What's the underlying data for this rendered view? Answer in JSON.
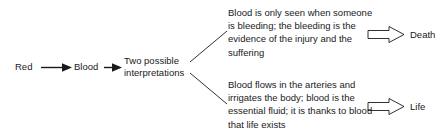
{
  "diagram": {
    "title": "Red Blood Two possible interpretations",
    "background_color": "#ffffff",
    "line_color": "#1a1a1a",
    "text_color": "#1a1a1a",
    "chain": {
      "node_1": "Red",
      "node_2": "Blood",
      "node_3_line_1": "Two possible",
      "node_3_line_2": "interpretations"
    },
    "branches": {
      "upper": {
        "text_line_1": "Blood is only seen when someone",
        "text_line_2": "is bleeding; the bleeding is the",
        "text_line_3": "evidence of the injury and the",
        "text_line_4": "suffering",
        "outcome": "Death"
      },
      "lower": {
        "text_line_1": "Blood flows in the arteries and",
        "text_line_2": "irrigates the body; blood is the",
        "text_line_3": "essential fluid; it is thanks to blood",
        "text_line_4": "that life exists",
        "outcome": "Life"
      }
    }
  }
}
